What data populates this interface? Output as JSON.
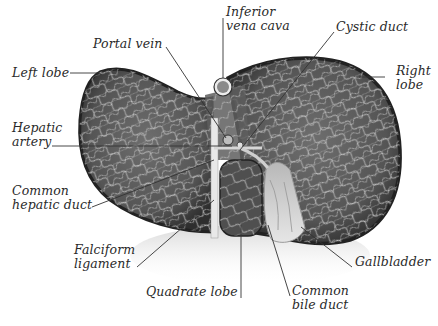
{
  "diagram": {
    "colors": {
      "tissue_dark": "#3a3a3a",
      "tissue_mid": "#7a7a7a",
      "vessel_light": "#d8d8d8",
      "capsule_edge": "#262626",
      "leader_line": "#333333",
      "label_text": "#2a2a2a",
      "background": "#ffffff"
    },
    "labels": [
      {
        "id": "left-lobe",
        "lines": [
          "Left lobe"
        ]
      },
      {
        "id": "portal-vein",
        "lines": [
          "Portal vein"
        ]
      },
      {
        "id": "inferior-vena-cava",
        "lines": [
          "Inferior",
          "vena cava"
        ]
      },
      {
        "id": "cystic-duct",
        "lines": [
          "Cystic duct"
        ]
      },
      {
        "id": "right-lobe",
        "lines": [
          "Right",
          "lobe"
        ]
      },
      {
        "id": "hepatic-artery",
        "lines": [
          "Hepatic",
          "artery"
        ]
      },
      {
        "id": "common-hepatic-duct",
        "lines": [
          "Common",
          "hepatic duct"
        ]
      },
      {
        "id": "falciform-ligament",
        "lines": [
          "Falciform",
          "ligament"
        ]
      },
      {
        "id": "gallbladder",
        "lines": [
          "Gallbladder"
        ]
      },
      {
        "id": "quadrate-lobe",
        "lines": [
          "Quadrate lobe"
        ]
      },
      {
        "id": "common-bile-duct",
        "lines": [
          "Common",
          "bile duct"
        ]
      }
    ]
  }
}
